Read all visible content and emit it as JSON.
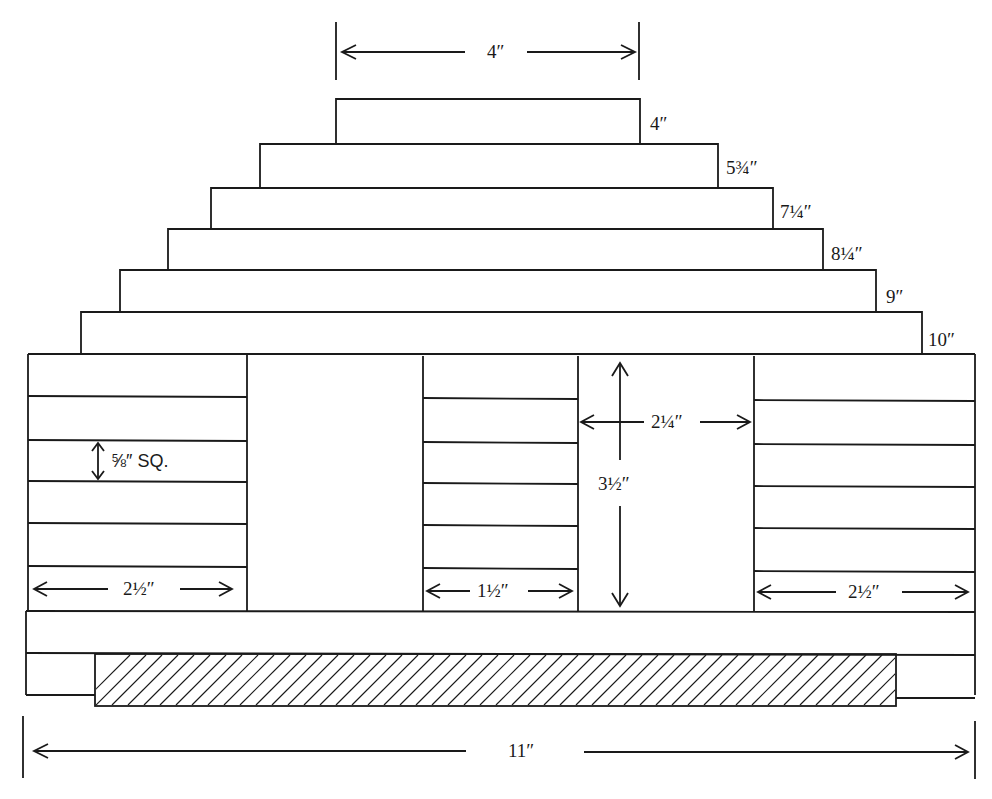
{
  "diagram": {
    "title": "",
    "type": "stepped-block construction drawing",
    "steps": [
      {
        "label": "4″",
        "width_in": 4
      },
      {
        "label": "5¾″",
        "width_in": 5.75
      },
      {
        "label": "7¼″",
        "width_in": 7.25
      },
      {
        "label": "8¼″",
        "width_in": 8.25
      },
      {
        "label": "9″",
        "width_in": 9
      },
      {
        "label": "10″",
        "width_in": 10
      }
    ],
    "dimensions": {
      "top_width": "4″",
      "stick_size": "⅝″ SQ.",
      "left_stack_width": "2½″",
      "middle_stack_width": "1½″",
      "right_stack_width": "2½″",
      "opening_width": "2¼″",
      "opening_height": "3½″",
      "overall_width": "11″"
    }
  }
}
